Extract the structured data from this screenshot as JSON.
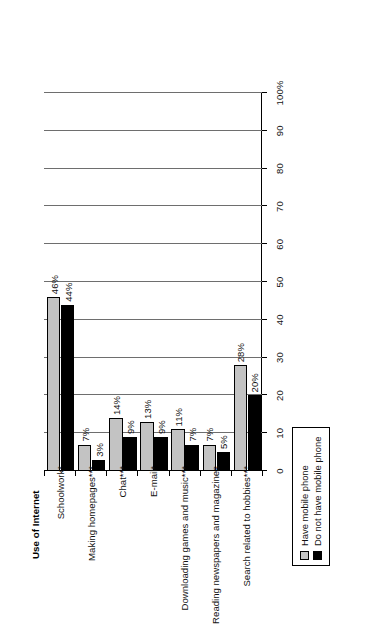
{
  "chart_data": {
    "type": "bar",
    "title": "Use of Internet",
    "xlabel": "",
    "ylabel": "",
    "orientation": "vertical-grouped-rotated",
    "grid": true,
    "legend_position": "right",
    "ylim": [
      0,
      100
    ],
    "yticks": [
      "0",
      "10",
      "20",
      "30",
      "40",
      "50",
      "60",
      "70",
      "80",
      "90",
      "100%"
    ],
    "ytick_values": [
      0,
      10,
      20,
      30,
      40,
      50,
      60,
      70,
      80,
      90,
      100
    ],
    "categories": [
      "Schoolwork*",
      "Making homepages***",
      "Chat***",
      "E-mail*",
      "Downloading games and music***",
      "Reading newspapers and magazines",
      "Search related to hobbies***"
    ],
    "series": [
      {
        "name": "Have mobile phone",
        "color": "#c3c3c3",
        "values": [
          46,
          7,
          14,
          13,
          11,
          7,
          28
        ],
        "labels": [
          "46%",
          "7%",
          "14%",
          "13%",
          "11%",
          "7%",
          "28%"
        ]
      },
      {
        "name": "Do not have mobile phone",
        "color": "#000000",
        "values": [
          44,
          3,
          9,
          9,
          7,
          5,
          20
        ],
        "labels": [
          "44%",
          "3%",
          "9%",
          "9%",
          "7%",
          "5%",
          "20%"
        ]
      }
    ]
  },
  "legend": {
    "items": [
      {
        "label": "Have mobile phone",
        "color": "#c3c3c3"
      },
      {
        "label": "Do not have mobile phone",
        "color": "#000000"
      }
    ]
  }
}
